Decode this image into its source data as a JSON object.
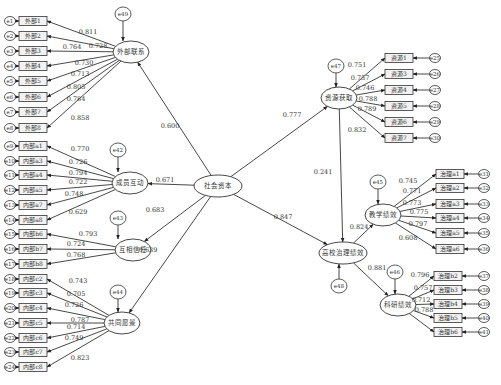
{
  "latents": [
    {
      "id": "external",
      "label": "外部联系",
      "x": 131,
      "y": 52,
      "rx": 18,
      "ry": 11,
      "err": "e49",
      "ex": 123,
      "ey": 14
    },
    {
      "id": "cohesion",
      "label": "成员互动",
      "x": 130,
      "y": 183,
      "rx": 18,
      "ry": 11,
      "err": "e42",
      "ex": 118,
      "ey": 150
    },
    {
      "id": "trust",
      "label": "互相信任",
      "x": 133,
      "y": 250,
      "rx": 18,
      "ry": 11,
      "err": "e43",
      "ex": 118,
      "ey": 218
    },
    {
      "id": "vision",
      "label": "共同愿景",
      "x": 122,
      "y": 323,
      "rx": 18,
      "ry": 11,
      "err": "e44",
      "ex": 118,
      "ey": 292
    },
    {
      "id": "social",
      "label": "社会资本",
      "x": 218,
      "y": 186,
      "rx": 24,
      "ry": 11
    },
    {
      "id": "resource",
      "label": "资源获取",
      "x": 339,
      "y": 98,
      "rx": 18,
      "ry": 11,
      "err": "e47",
      "ex": 336,
      "ey": 66
    },
    {
      "id": "governance",
      "label": "高校治理绩效",
      "x": 343,
      "y": 253,
      "rx": 24,
      "ry": 11,
      "err": "e48",
      "ex": 339,
      "ey": 286
    },
    {
      "id": "teaching",
      "label": "教学绩效",
      "x": 383,
      "y": 215,
      "rx": 18,
      "ry": 11,
      "err": "e45",
      "ex": 378,
      "ey": 182
    },
    {
      "id": "research",
      "label": "科研绩效",
      "x": 398,
      "y": 305,
      "rx": 18,
      "ry": 11,
      "err": "e46",
      "ex": 395,
      "ey": 272
    }
  ],
  "indicator_groups": [
    {
      "latent": "external",
      "side": "left",
      "box_x": 19,
      "err_x": 5,
      "items": [
        {
          "label": "外部1",
          "err": "e1",
          "y": 21,
          "coef": "0.811",
          "cx": 88,
          "cy": 34
        },
        {
          "label": "外部2",
          "err": "e2",
          "y": 36,
          "coef": "0.728",
          "cx": 98,
          "cy": 48
        },
        {
          "label": "外部3",
          "err": "e3",
          "y": 51,
          "coef": "0.764",
          "cx": 72,
          "cy": 49
        },
        {
          "label": "外部4",
          "err": "e4",
          "y": 66,
          "coef": "0.730",
          "cx": 84,
          "cy": 65
        },
        {
          "label": "外部5",
          "err": "e5",
          "y": 81,
          "coef": "0.713",
          "cx": 80,
          "cy": 76
        },
        {
          "label": "外部6",
          "err": "e6",
          "y": 97,
          "coef": "0.805",
          "cx": 76,
          "cy": 89
        },
        {
          "label": "外部7",
          "err": "e7",
          "y": 112,
          "coef": "0.784",
          "cx": 76,
          "cy": 101
        },
        {
          "label": "外部8",
          "err": "e8",
          "y": 128,
          "coef": "0.858",
          "cx": 80,
          "cy": 120
        }
      ]
    },
    {
      "latent": "cohesion",
      "side": "left",
      "box_x": 19,
      "err_x": 5,
      "items": [
        {
          "label": "内部a1",
          "err": "e9",
          "y": 146,
          "coef": "0.770",
          "cx": 80,
          "cy": 151
        },
        {
          "label": "内部a3",
          "err": "e10",
          "y": 161,
          "coef": "0.726",
          "cx": 78,
          "cy": 164
        },
        {
          "label": "内部a4",
          "err": "e11",
          "y": 175,
          "coef": "0.794",
          "cx": 78,
          "cy": 175
        },
        {
          "label": "内部a5",
          "err": "e12",
          "y": 190,
          "coef": "0.722",
          "cx": 78,
          "cy": 184
        },
        {
          "label": "内部a7",
          "err": "e13",
          "y": 205,
          "coef": "0.748",
          "cx": 74,
          "cy": 196
        },
        {
          "label": "内部a8",
          "err": "e14",
          "y": 220,
          "coef": "0.629",
          "cx": 78,
          "cy": 214
        }
      ]
    },
    {
      "latent": "trust",
      "side": "left",
      "box_x": 19,
      "err_x": 5,
      "items": [
        {
          "label": "内部b6",
          "err": "e15",
          "y": 234,
          "coef": "0.793",
          "cx": 88,
          "cy": 236
        },
        {
          "label": "内部b7",
          "err": "e16",
          "y": 249,
          "coef": "0.724",
          "cx": 76,
          "cy": 246
        },
        {
          "label": "内部b8",
          "err": "e17",
          "y": 264,
          "coef": "0.768",
          "cx": 76,
          "cy": 257
        }
      ]
    },
    {
      "latent": "vision",
      "side": "left",
      "box_x": 19,
      "err_x": 5,
      "items": [
        {
          "label": "内部c2",
          "err": "e18",
          "y": 279,
          "coef": "0.743",
          "cx": 78,
          "cy": 283
        },
        {
          "label": "内部c3",
          "err": "e19",
          "y": 293,
          "coef": "0.705",
          "cx": 76,
          "cy": 296
        },
        {
          "label": "内部c4",
          "err": "e20",
          "y": 308,
          "coef": "0.726",
          "cx": 74,
          "cy": 307
        },
        {
          "label": "内部c5",
          "err": "e21",
          "y": 323,
          "coef": "0.787",
          "cx": 80,
          "cy": 322
        },
        {
          "label": "内部c6",
          "err": "e22",
          "y": 338,
          "coef": "0.714",
          "cx": 76,
          "cy": 329
        },
        {
          "label": "内部c7",
          "err": "e23",
          "y": 352,
          "coef": "0.749",
          "cx": 74,
          "cy": 340
        },
        {
          "label": "内部c8",
          "err": "e24",
          "y": 367,
          "coef": "0.823",
          "cx": 80,
          "cy": 360
        }
      ]
    },
    {
      "latent": "resource",
      "side": "right",
      "box_x": 385,
      "err_x": 430,
      "items": [
        {
          "label": "资源1",
          "err": "e25",
          "y": 58,
          "coef": "0.751",
          "cx": 357,
          "cy": 67
        },
        {
          "label": "资源3",
          "err": "e26",
          "y": 74,
          "coef": "0.757",
          "cx": 360,
          "cy": 80
        },
        {
          "label": "资源4",
          "err": "e27",
          "y": 90,
          "coef": "0.746",
          "cx": 365,
          "cy": 90
        },
        {
          "label": "资源5",
          "err": "e28",
          "y": 106,
          "coef": "0.788",
          "cx": 368,
          "cy": 101
        },
        {
          "label": "资源6",
          "err": "e29",
          "y": 122,
          "coef": "0.789",
          "cx": 367,
          "cy": 111
        },
        {
          "label": "资源7",
          "err": "e30",
          "y": 138,
          "coef": "0.832",
          "cx": 357,
          "cy": 132
        }
      ]
    },
    {
      "latent": "teaching",
      "side": "right",
      "box_x": 436,
      "err_x": 479,
      "items": [
        {
          "label": "治理a1",
          "err": "e31",
          "y": 174,
          "coef": "0.745",
          "cx": 408,
          "cy": 183
        },
        {
          "label": "治理a2",
          "err": "e32",
          "y": 188,
          "coef": "0.771",
          "cx": 412,
          "cy": 193
        },
        {
          "label": "治理a3",
          "err": "e33",
          "y": 204,
          "coef": "0.773",
          "cx": 412,
          "cy": 205
        },
        {
          "label": "治理a4",
          "err": "e34",
          "y": 218,
          "coef": "0.775",
          "cx": 419,
          "cy": 214
        },
        {
          "label": "治理a5",
          "err": "e35",
          "y": 233,
          "coef": "0.797",
          "cx": 418,
          "cy": 226
        },
        {
          "label": "治理a6",
          "err": "e36",
          "y": 249,
          "coef": "0.608",
          "cx": 408,
          "cy": 240
        }
      ]
    },
    {
      "latent": "research",
      "side": "right",
      "box_x": 434,
      "err_x": 479,
      "items": [
        {
          "label": "治理b2",
          "err": "e37",
          "y": 276,
          "coef": "0.796",
          "cx": 420,
          "cy": 277
        },
        {
          "label": "治理b3",
          "err": "e38",
          "y": 290,
          "coef": "0.757",
          "cx": 423,
          "cy": 290
        },
        {
          "label": "治理b4",
          "err": "e39",
          "y": 304,
          "coef": "0.712",
          "cx": 421,
          "cy": 302
        },
        {
          "label": "治理b5",
          "err": "e40",
          "y": 318,
          "coef": "0.788",
          "cx": 424,
          "cy": 312
        },
        {
          "label": "治理b6",
          "err": "e41",
          "y": 332,
          "coef": "0.777",
          "cx": 420,
          "cy": 0
        }
      ]
    }
  ],
  "structural_paths": [
    {
      "from": "social",
      "to": "external",
      "coef": "0.600",
      "cx": 170,
      "cy": 128
    },
    {
      "from": "social",
      "to": "cohesion",
      "coef": "0.671",
      "cx": 165,
      "cy": 182
    },
    {
      "from": "social",
      "to": "trust",
      "coef": "0.683",
      "cx": 155,
      "cy": 212
    },
    {
      "from": "social",
      "to": "vision",
      "coef": "0.639",
      "cx": 148,
      "cy": 252
    },
    {
      "from": "social",
      "to": "resource",
      "coef": "0.777",
      "cx": 292,
      "cy": 117
    },
    {
      "from": "social",
      "to": "governance",
      "coef": "0.847",
      "cx": 283,
      "cy": 219
    },
    {
      "from": "resource",
      "to": "governance",
      "coef": "0.241",
      "cx": 323,
      "cy": 174
    },
    {
      "from": "governance",
      "to": "teaching",
      "coef": "0.824",
      "cx": 359,
      "cy": 229
    },
    {
      "from": "governance",
      "to": "research",
      "coef": "0.881",
      "cx": 377,
      "cy": 270
    }
  ]
}
